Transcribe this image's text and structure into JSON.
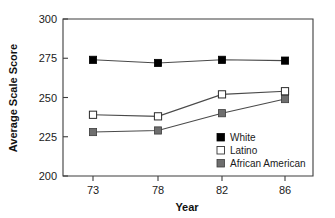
{
  "chart_data": {
    "type": "line",
    "title": "",
    "xlabel": "Year",
    "ylabel": "Average Scale Score",
    "categories": [
      "73",
      "78",
      "82",
      "86"
    ],
    "x": [
      73,
      78,
      82,
      86
    ],
    "xticklabels": [
      "73",
      "78",
      "82",
      "86"
    ],
    "yticklabels": [
      "200",
      "225",
      "250",
      "275",
      "300"
    ],
    "yticks": [
      200,
      225,
      250,
      275,
      300
    ],
    "ylim": [
      200,
      300
    ],
    "xlim": [
      71.2,
      87.8
    ],
    "grid": false,
    "legend_position": "inside-bottom-right",
    "series": [
      {
        "name": "White",
        "values": [
          274,
          272,
          274,
          273.5
        ],
        "marker": "filled-square",
        "marker_color": "#000000",
        "line_color": "#4a4a4a"
      },
      {
        "name": "Latino",
        "values": [
          239,
          238,
          252,
          254
        ],
        "marker": "open-square",
        "marker_color": "#ffffff",
        "line_color": "#4a4a4a"
      },
      {
        "name": "African American",
        "values": [
          228,
          229,
          240,
          249
        ],
        "marker": "gray-square",
        "marker_color": "#6e6e6e",
        "line_color": "#4a4a4a"
      }
    ],
    "colors": {
      "white_series": "#000000",
      "latino_series": "#ffffff",
      "african_american_series": "#6e6e6e",
      "axis": "#3d3d3d",
      "text": "#1a1a1a",
      "background": "#ffffff"
    }
  },
  "legend": {
    "entries": [
      {
        "label": "White",
        "swatch": "filled-square-black"
      },
      {
        "label": "Latino",
        "swatch": "open-square-white"
      },
      {
        "label": "African American",
        "swatch": "filled-square-gray"
      }
    ]
  },
  "axes": {
    "y_title": "Average Scale Score",
    "x_title": "Year"
  }
}
